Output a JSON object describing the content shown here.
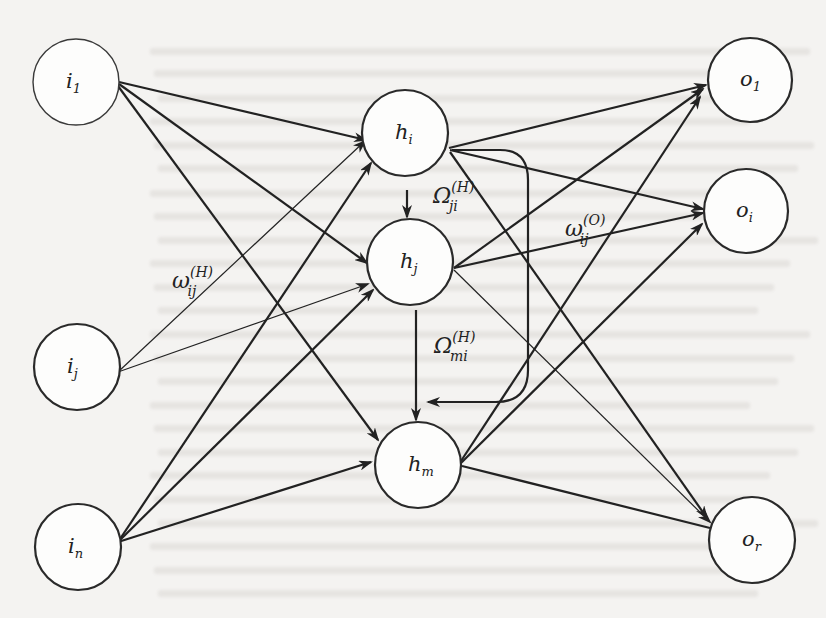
{
  "diagram": {
    "background_color": "#f4f3f1",
    "stroke_color": "#222222",
    "nodes": [
      {
        "id": "i1",
        "layer": "input",
        "base": "i",
        "sub": "1",
        "cx": 76,
        "cy": 82,
        "r": 43,
        "light": true
      },
      {
        "id": "ij",
        "layer": "input",
        "base": "i",
        "sub": "j",
        "cx": 77,
        "cy": 367,
        "r": 43
      },
      {
        "id": "in",
        "layer": "input",
        "base": "i",
        "sub": "n",
        "cx": 78,
        "cy": 547,
        "r": 43
      },
      {
        "id": "hi",
        "layer": "hidden",
        "base": "h",
        "sub": "i",
        "cx": 405,
        "cy": 133,
        "r": 43
      },
      {
        "id": "hj",
        "layer": "hidden",
        "base": "h",
        "sub": "j",
        "cx": 410,
        "cy": 262,
        "r": 43
      },
      {
        "id": "hm",
        "layer": "hidden",
        "base": "h",
        "sub": "m",
        "cx": 418,
        "cy": 465,
        "r": 43
      },
      {
        "id": "o1",
        "layer": "output",
        "base": "o",
        "sub": "1",
        "cx": 750,
        "cy": 80,
        "r": 42
      },
      {
        "id": "oi",
        "layer": "output",
        "base": "o",
        "sub": "i",
        "cx": 746,
        "cy": 211,
        "r": 42
      },
      {
        "id": "or",
        "layer": "output",
        "base": "o",
        "sub": "r",
        "cx": 752,
        "cy": 540,
        "r": 43
      }
    ],
    "edges": [
      {
        "from": "i1",
        "to": "hi",
        "x1": 119,
        "y1": 82,
        "x2": 366,
        "y2": 140
      },
      {
        "from": "i1",
        "to": "hj",
        "x1": 119,
        "y1": 84,
        "x2": 367,
        "y2": 263
      },
      {
        "from": "i1",
        "to": "hm",
        "x1": 118,
        "y1": 86,
        "x2": 378,
        "y2": 440
      },
      {
        "from": "ij",
        "to": "hi",
        "x1": 118,
        "y1": 372,
        "x2": 365,
        "y2": 141,
        "thin": true
      },
      {
        "from": "ij",
        "to": "hj",
        "x1": 118,
        "y1": 372,
        "x2": 368,
        "y2": 284,
        "thin": true
      },
      {
        "from": "in",
        "to": "hi",
        "x1": 118,
        "y1": 542,
        "x2": 371,
        "y2": 163
      },
      {
        "from": "in",
        "to": "hj",
        "x1": 118,
        "y1": 542,
        "x2": 373,
        "y2": 290
      },
      {
        "from": "in",
        "to": "hm",
        "x1": 118,
        "y1": 542,
        "x2": 371,
        "y2": 462
      },
      {
        "from": "hi",
        "to": "hj",
        "x1": 407,
        "y1": 190,
        "x2": 407,
        "y2": 217
      },
      {
        "from": "hj",
        "to": "hm",
        "x1": 416,
        "y1": 310,
        "x2": 416,
        "y2": 420
      },
      {
        "from": "hi",
        "to": "o1",
        "x1": 449,
        "y1": 148,
        "x2": 706,
        "y2": 85
      },
      {
        "from": "hi",
        "to": "oi",
        "x1": 450,
        "y1": 150,
        "x2": 703,
        "y2": 209
      },
      {
        "from": "hi",
        "to": "or",
        "x1": 450,
        "y1": 152,
        "x2": 707,
        "y2": 518
      },
      {
        "from": "hj",
        "to": "o1",
        "x1": 454,
        "y1": 268,
        "x2": 703,
        "y2": 89
      },
      {
        "from": "hj",
        "to": "oi",
        "x1": 454,
        "y1": 268,
        "x2": 703,
        "y2": 213
      },
      {
        "from": "hj",
        "to": "or",
        "x1": 454,
        "y1": 270,
        "x2": 710,
        "y2": 522,
        "thin": true
      },
      {
        "from": "hm",
        "to": "o1",
        "x1": 461,
        "y1": 461,
        "x2": 700,
        "y2": 97
      },
      {
        "from": "hm",
        "to": "oi",
        "x1": 461,
        "y1": 463,
        "x2": 702,
        "y2": 224
      },
      {
        "from": "hm",
        "to": "or",
        "x1": 462,
        "y1": 466,
        "x2": 710,
        "y2": 528,
        "arrow": false
      }
    ],
    "loop": {
      "from": "hi",
      "to": "hm",
      "path": "M 452 150 L 500 150 Q 528 150 528 180 L 528 370 Q 528 402 496 402 L 428 402"
    },
    "labels": [
      {
        "id": "w_ij_H",
        "symbol": "ω",
        "sup": "(H)",
        "sub": "ij",
        "x": 172,
        "y": 288
      },
      {
        "id": "Omega_ji_H",
        "symbol": "Ω",
        "sup": "(H)",
        "sub": "ji",
        "x": 433,
        "y": 203
      },
      {
        "id": "w_ij_O",
        "symbol": "ω",
        "sup": "(O)",
        "sub": "ij",
        "x": 565,
        "y": 236
      },
      {
        "id": "Omega_mi_H",
        "symbol": "Ω",
        "sup": "(H)",
        "sub": "mi",
        "x": 434,
        "y": 353
      }
    ]
  }
}
